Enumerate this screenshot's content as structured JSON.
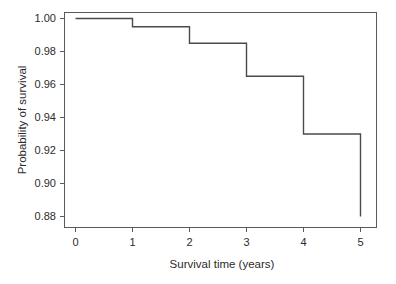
{
  "chart_data": {
    "type": "line",
    "subtype": "kaplan-meier-step",
    "title": "",
    "xlabel": "Survival time (years)",
    "ylabel": "Probability of survival",
    "xlim": [
      -0.25,
      5.3
    ],
    "ylim": [
      0.873,
      1.006
    ],
    "grid": false,
    "legend": false,
    "xticks": [
      0,
      1,
      2,
      3,
      4,
      5
    ],
    "xticklabels": [
      "0",
      "1",
      "2",
      "3",
      "4",
      "5"
    ],
    "yticks": [
      0.88,
      0.9,
      0.92,
      0.94,
      0.96,
      0.98,
      1.0
    ],
    "yticklabels": [
      "0.88",
      "0.90",
      "0.92",
      "0.94",
      "0.96",
      "0.98",
      "1.00"
    ],
    "line_color": "#4a4a4a",
    "frame_color": "#5a5a5a",
    "background_color": "#ffffff",
    "series": [
      {
        "name": "Survival probability",
        "x": [
          0,
          1,
          1,
          2,
          2,
          3,
          3,
          4,
          4,
          5,
          5
        ],
        "y": [
          1.0,
          1.0,
          0.995,
          0.995,
          0.985,
          0.985,
          0.965,
          0.965,
          0.93,
          0.93,
          0.88
        ]
      }
    ],
    "steps": [
      {
        "time": 0,
        "survival": 1.0
      },
      {
        "time": 1,
        "survival": 0.995
      },
      {
        "time": 2,
        "survival": 0.985
      },
      {
        "time": 3,
        "survival": 0.965
      },
      {
        "time": 4,
        "survival": 0.93
      },
      {
        "time": 5,
        "survival": 0.88
      }
    ]
  }
}
